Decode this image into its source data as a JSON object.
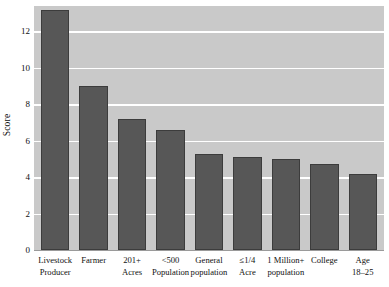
{
  "chart_data": {
    "type": "bar",
    "title": "",
    "subtitle": "",
    "xlabel": "",
    "ylabel": "Score",
    "ylim": [
      0,
      13.4
    ],
    "grid": true,
    "legend": false,
    "orientation": "vertical",
    "bar_color": "#575757",
    "plot_background": "#c9c9c9",
    "gridline_color": "#ffffff",
    "categories": [
      "Livestock\nProducer",
      "Farmer",
      "201+\nAcres",
      "<500\nPopulation",
      "General\npopulation",
      "≤1/4\nAcre",
      "1 Million+\npopulation",
      "College",
      "Age\n18–25"
    ],
    "values": [
      13.2,
      9.0,
      7.2,
      6.6,
      5.3,
      5.1,
      5.0,
      4.7,
      4.2
    ],
    "yticks": [
      0,
      2,
      4,
      6,
      8,
      10,
      12
    ],
    "ytick_labels": [
      "0",
      "2",
      "4",
      "6",
      "8",
      "10",
      "12"
    ]
  },
  "axis": {
    "y_title": "Score"
  }
}
